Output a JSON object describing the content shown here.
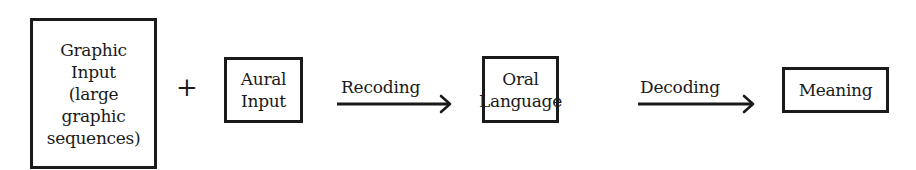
{
  "diagram": {
    "type": "flow",
    "nodes": [
      {
        "id": "graphic_input",
        "lines": [
          "Graphic",
          "Input",
          "(large",
          "graphic",
          "sequences)"
        ]
      },
      {
        "id": "aural_input",
        "lines": [
          "Aural",
          "Input"
        ]
      },
      {
        "id": "oral_language",
        "lines": [
          "Oral",
          "Language"
        ]
      },
      {
        "id": "meaning",
        "lines": [
          "Meaning"
        ]
      }
    ],
    "operators": [
      {
        "between": [
          "graphic_input",
          "aural_input"
        ],
        "symbol": "+"
      }
    ],
    "edges": [
      {
        "from": "aural_input",
        "to": "oral_language",
        "label": "Recoding"
      },
      {
        "from": "oral_language",
        "to": "meaning",
        "label": "Decoding"
      }
    ]
  },
  "colors": {
    "ink": "#1a1a1a",
    "background": "#ffffff"
  }
}
